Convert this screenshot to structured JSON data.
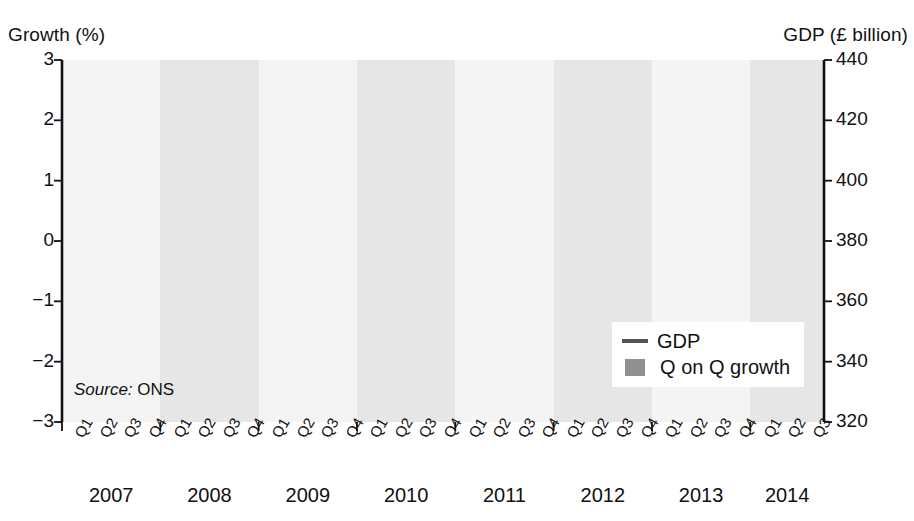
{
  "axis_titles": {
    "left": "Growth (%)",
    "right": "GDP (£ billion)"
  },
  "source": {
    "prefix": "Source:",
    "value": "ONS"
  },
  "legend": {
    "position": "bottom-right-inside",
    "items": [
      {
        "label": "GDP",
        "marker": "line",
        "color": "#555555"
      },
      {
        "label": "Q on Q growth",
        "marker": "bar",
        "color": "#8f8f8f"
      }
    ]
  },
  "colors": {
    "bar": "#8f8f8f",
    "line": "#555555",
    "axis": "#111111",
    "band_light": "#f4f4f4",
    "band_dark": "#e6e6e6",
    "background": "#ffffff"
  },
  "chart_data": {
    "type": "bar",
    "title": "",
    "subtitle": "",
    "xlabel": "",
    "ylabel": "Growth (%)",
    "y2label": "GDP (£ billion)",
    "ylim": [
      -3,
      3
    ],
    "yticks": [
      3,
      2,
      1,
      0,
      -1,
      -2,
      -3
    ],
    "ytick_labels": [
      "3",
      "2",
      "1",
      "0",
      "−1",
      "−2",
      "−3"
    ],
    "y2lim": [
      320,
      440
    ],
    "y2ticks": [
      440,
      420,
      400,
      380,
      360,
      340,
      320
    ],
    "y2tick_labels": [
      "440",
      "420",
      "400",
      "380",
      "360",
      "340",
      "320"
    ],
    "grid": false,
    "legend_position": "lower right",
    "categories": [
      "Q1",
      "Q2",
      "Q3",
      "Q4",
      "Q1",
      "Q2",
      "Q3",
      "Q4",
      "Q1",
      "Q2",
      "Q3",
      "Q4",
      "Q1",
      "Q2",
      "Q3",
      "Q4",
      "Q1",
      "Q2",
      "Q3",
      "Q4",
      "Q1",
      "Q2",
      "Q3",
      "Q4",
      "Q1",
      "Q2",
      "Q3",
      "Q4",
      "Q1",
      "Q2",
      "Q3"
    ],
    "years": [
      {
        "label": "2007",
        "quarters": 4,
        "band": "light"
      },
      {
        "label": "2008",
        "quarters": 4,
        "band": "dark"
      },
      {
        "label": "2009",
        "quarters": 4,
        "band": "light"
      },
      {
        "label": "2010",
        "quarters": 4,
        "band": "dark"
      },
      {
        "label": "2011",
        "quarters": 4,
        "band": "light"
      },
      {
        "label": "2012",
        "quarters": 4,
        "band": "dark"
      },
      {
        "label": "2013",
        "quarters": 4,
        "band": "light"
      },
      {
        "label": "2014",
        "quarters": 3,
        "band": "dark"
      }
    ],
    "series": [
      {
        "name": "Q on Q growth",
        "type": "bar",
        "axis": "left",
        "unit": "%",
        "color": "#8f8f8f",
        "values": [
          0.78,
          0.58,
          0.73,
          0.49,
          0.27,
          -0.17,
          -1.73,
          -2.2,
          -1.8,
          -0.3,
          0.13,
          0.37,
          0.49,
          0.95,
          0.55,
          0.0,
          0.47,
          0.13,
          0.62,
          0.03,
          -0.2,
          0.7,
          -0.3,
          0.43,
          0.6,
          0.82,
          0.53,
          0.6,
          0.82,
          0.6,
          0.6
        ]
      },
      {
        "name": "GDP",
        "type": "line",
        "axis": "right",
        "unit": "£ billion",
        "color": "#555555",
        "values": [
          404.4,
          406.6,
          408.0,
          409.6,
          411.1,
          411.9,
          410.4,
          402.6,
          393.5,
          389.9,
          389.3,
          389.6,
          390.7,
          393.5,
          395.3,
          395.6,
          396.3,
          396.8,
          398.3,
          399.9,
          400.9,
          400.6,
          400.1,
          402.6,
          401.3,
          404.4,
          408.0,
          411.5,
          415.8,
          420.5,
          425.3
        ]
      }
    ]
  }
}
